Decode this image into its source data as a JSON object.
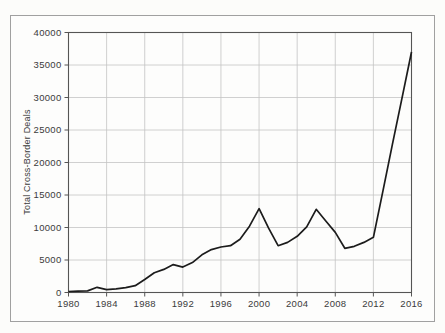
{
  "figure": {
    "background": "#fcfcfa",
    "frame_border_color": "#a0a0a0"
  },
  "chart_data": {
    "type": "line",
    "title": "",
    "xlabel": "",
    "ylabel": "Total Cross-Border Deals",
    "xlim": [
      1980,
      2016
    ],
    "ylim": [
      0,
      40000
    ],
    "xticks": [
      "1980",
      "1984",
      "1988",
      "1992",
      "1996",
      "2000",
      "2004",
      "2008",
      "2012",
      "2016"
    ],
    "xtick_values": [
      1980,
      1984,
      1988,
      1992,
      1996,
      2000,
      2004,
      2008,
      2012,
      2016
    ],
    "yticks": [
      "0",
      "5000",
      "10000",
      "15000",
      "20000",
      "25000",
      "30000",
      "35000",
      "40000"
    ],
    "ytick_values": [
      0,
      5000,
      10000,
      15000,
      20000,
      25000,
      30000,
      35000,
      40000
    ],
    "grid": true,
    "legend": false,
    "series": [
      {
        "name": "Total Cross-Border Deals",
        "x": [
          1980,
          1981,
          1982,
          1983,
          1984,
          1985,
          1986,
          1987,
          1988,
          1989,
          1990,
          1991,
          1992,
          1993,
          1994,
          1995,
          1996,
          1997,
          1998,
          1999,
          2000,
          2001,
          2002,
          2003,
          2004,
          2005,
          2006,
          2007,
          2008,
          2009,
          2010,
          2011,
          2012,
          2013,
          2014,
          2015,
          2016
        ],
        "values": [
          150,
          200,
          250,
          800,
          450,
          550,
          750,
          1050,
          2000,
          3050,
          3550,
          4300,
          3900,
          4600,
          5800,
          6600,
          7000,
          7200,
          8200,
          10200,
          12900,
          9900,
          7200,
          7700,
          8650,
          10100,
          12800,
          11000,
          9250,
          6800,
          7100,
          7700,
          8500,
          15600,
          22800,
          29900,
          37000
        ]
      }
    ],
    "line_color": "#1c1c1c",
    "grid_color": "#c4c4c4",
    "axis_color": "#555555",
    "tick_label_color": "#3b3b3b"
  }
}
